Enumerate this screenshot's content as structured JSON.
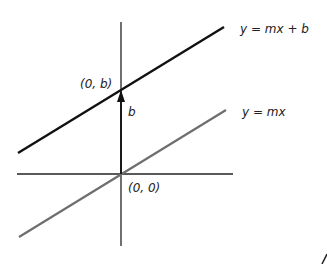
{
  "diagram": {
    "type": "linear-function-intercept",
    "labels": {
      "line_shifted": "y = mx + b",
      "line_origin": "y = mx",
      "intercept_point": "(0, b)",
      "origin_point": "(0, 0)",
      "offset": "b"
    },
    "colors": {
      "line_shifted": "#111111",
      "line_origin": "#6e6e6e",
      "axes": "#222222",
      "arrow": "#111111"
    }
  }
}
